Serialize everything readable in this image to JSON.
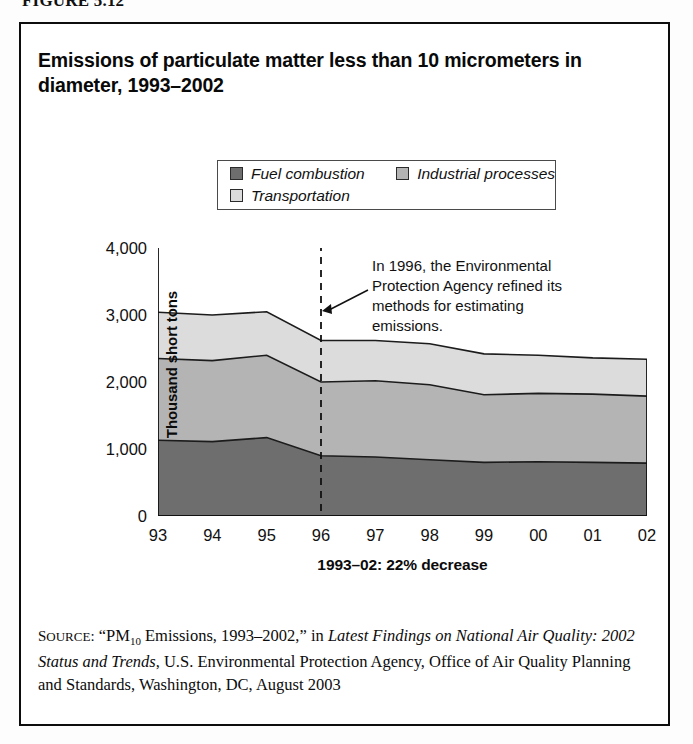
{
  "figure_label": "FIGURE 5.12",
  "chart_title": "Emissions of particulate matter less than 10 micrometers in diameter, 1993–2002",
  "legend": {
    "entries": [
      {
        "label": "Fuel combustion",
        "color": "#6e6e6e"
      },
      {
        "label": "Industrial processes",
        "color": "#b4b4b4"
      },
      {
        "label": "Transportation",
        "color": "#dcdcdc"
      }
    ]
  },
  "annotation": "In 1996, the Environmental Protection Agency refined its methods for estimating emissions.",
  "x_axis_caption": "1993–02: 22% decrease",
  "y_axis_title": "Thousand short tons",
  "source": {
    "prefix": "SOURCE:",
    "quoted_title": "“PM10 Emissions, 1993–2002,”",
    "in_word": "in",
    "italic_title": "Latest Findings on National Air Quality: 2002 Status and Trends",
    "rest": ", U.S. Environmental Protection Agency, Office of Air Quality Planning and Standards, Washington, DC, August 2003"
  },
  "chart_data": {
    "type": "area",
    "stacked": true,
    "title": "Emissions of particulate matter less than 10 micrometers in diameter, 1993–2002",
    "xlabel": "1993–02: 22% decrease",
    "ylabel": "Thousand short tons",
    "categories": [
      "93",
      "94",
      "95",
      "96",
      "97",
      "98",
      "99",
      "00",
      "01",
      "02"
    ],
    "x_tick_labels": [
      "93",
      "94",
      "95",
      "96",
      "97",
      "98",
      "99",
      "00",
      "01",
      "02"
    ],
    "y_tick_labels": [
      "4,000",
      "3,000",
      "2,000",
      "1,000",
      "0"
    ],
    "y_tick_values": [
      4000,
      3000,
      2000,
      1000,
      0
    ],
    "ylim": [
      0,
      4000
    ],
    "grid": false,
    "legend_position": "top-center",
    "series": [
      {
        "name": "Fuel combustion",
        "color": "#6e6e6e",
        "values": [
          1130,
          1110,
          1170,
          900,
          880,
          840,
          800,
          810,
          800,
          790
        ]
      },
      {
        "name": "Industrial processes",
        "color": "#b4b4b4",
        "values": [
          1220,
          1210,
          1230,
          1100,
          1140,
          1120,
          1010,
          1020,
          1020,
          1000
        ]
      },
      {
        "name": "Transportation",
        "color": "#dcdcdc",
        "values": [
          690,
          680,
          650,
          620,
          600,
          610,
          610,
          570,
          540,
          550
        ]
      }
    ],
    "cumulative_fuel": [
      1130,
      1110,
      1170,
      900,
      880,
      840,
      800,
      810,
      800,
      790
    ],
    "cumulative_fuel_industrial": [
      2350,
      2320,
      2400,
      2000,
      2020,
      1960,
      1810,
      1830,
      1820,
      1790
    ],
    "cumulative_total": [
      3040,
      3000,
      3050,
      2620,
      2620,
      2570,
      2420,
      2400,
      2360,
      2340
    ],
    "annotations": [
      {
        "text": "In 1996, the Environmental Protection Agency refined its methods for estimating emissions.",
        "x": "96",
        "marker": "dashed-vertical-line-with-arrow"
      }
    ]
  }
}
